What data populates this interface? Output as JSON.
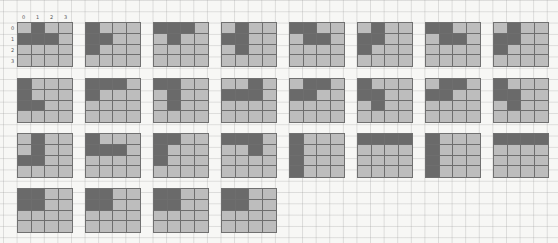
{
  "figure": {
    "grid_size": 4,
    "axis_labels": {
      "columns": [
        "0",
        "1",
        "2",
        "3"
      ],
      "rows": [
        "0",
        "1",
        "2",
        "3"
      ]
    },
    "colors": {
      "filled": "#6a6a6a",
      "empty": "#bdbdbd",
      "grid_line": "#6e6e6e",
      "paper": "#f7f7f5"
    },
    "tiles": [
      {
        "id": 1,
        "filled": [
          [
            0,
            1
          ],
          [
            1,
            0
          ],
          [
            1,
            1
          ],
          [
            1,
            2
          ]
        ]
      },
      {
        "id": 2,
        "filled": [
          [
            0,
            0
          ],
          [
            1,
            0
          ],
          [
            1,
            1
          ],
          [
            2,
            0
          ]
        ]
      },
      {
        "id": 3,
        "filled": [
          [
            0,
            0
          ],
          [
            0,
            1
          ],
          [
            0,
            2
          ],
          [
            1,
            1
          ]
        ]
      },
      {
        "id": 4,
        "filled": [
          [
            0,
            1
          ],
          [
            1,
            0
          ],
          [
            1,
            1
          ],
          [
            2,
            1
          ]
        ]
      },
      {
        "id": 5,
        "filled": [
          [
            0,
            0
          ],
          [
            0,
            1
          ],
          [
            1,
            1
          ],
          [
            1,
            2
          ]
        ]
      },
      {
        "id": 6,
        "filled": [
          [
            0,
            1
          ],
          [
            1,
            0
          ],
          [
            1,
            1
          ],
          [
            2,
            0
          ]
        ]
      },
      {
        "id": 7,
        "filled": [
          [
            0,
            0
          ],
          [
            0,
            1
          ],
          [
            1,
            1
          ],
          [
            1,
            2
          ]
        ]
      },
      {
        "id": 8,
        "filled": [
          [
            0,
            1
          ],
          [
            1,
            0
          ],
          [
            1,
            1
          ],
          [
            2,
            0
          ]
        ]
      },
      {
        "id": 9,
        "filled": [
          [
            0,
            0
          ],
          [
            1,
            0
          ],
          [
            2,
            0
          ],
          [
            2,
            1
          ]
        ]
      },
      {
        "id": 10,
        "filled": [
          [
            0,
            0
          ],
          [
            0,
            1
          ],
          [
            0,
            2
          ],
          [
            1,
            0
          ]
        ]
      },
      {
        "id": 11,
        "filled": [
          [
            0,
            0
          ],
          [
            0,
            1
          ],
          [
            1,
            1
          ],
          [
            2,
            1
          ]
        ]
      },
      {
        "id": 12,
        "filled": [
          [
            0,
            2
          ],
          [
            1,
            0
          ],
          [
            1,
            1
          ],
          [
            1,
            2
          ]
        ]
      },
      {
        "id": 13,
        "filled": [
          [
            0,
            1
          ],
          [
            0,
            2
          ],
          [
            1,
            0
          ],
          [
            1,
            1
          ]
        ]
      },
      {
        "id": 14,
        "filled": [
          [
            0,
            0
          ],
          [
            1,
            0
          ],
          [
            1,
            1
          ],
          [
            2,
            1
          ]
        ]
      },
      {
        "id": 15,
        "filled": [
          [
            0,
            1
          ],
          [
            0,
            2
          ],
          [
            1,
            0
          ],
          [
            1,
            1
          ]
        ]
      },
      {
        "id": 16,
        "filled": [
          [
            0,
            0
          ],
          [
            1,
            0
          ],
          [
            1,
            1
          ],
          [
            2,
            1
          ]
        ]
      },
      {
        "id": 17,
        "filled": [
          [
            0,
            1
          ],
          [
            1,
            1
          ],
          [
            2,
            0
          ],
          [
            2,
            1
          ]
        ]
      },
      {
        "id": 18,
        "filled": [
          [
            0,
            0
          ],
          [
            1,
            0
          ],
          [
            1,
            1
          ],
          [
            1,
            2
          ]
        ]
      },
      {
        "id": 19,
        "filled": [
          [
            0,
            0
          ],
          [
            0,
            1
          ],
          [
            1,
            0
          ],
          [
            2,
            0
          ]
        ]
      },
      {
        "id": 20,
        "filled": [
          [
            0,
            0
          ],
          [
            0,
            1
          ],
          [
            0,
            2
          ],
          [
            1,
            2
          ]
        ]
      },
      {
        "id": 21,
        "filled": [
          [
            0,
            0
          ],
          [
            1,
            0
          ],
          [
            2,
            0
          ],
          [
            3,
            0
          ]
        ]
      },
      {
        "id": 22,
        "filled": [
          [
            0,
            0
          ],
          [
            0,
            1
          ],
          [
            0,
            2
          ],
          [
            0,
            3
          ]
        ]
      },
      {
        "id": 23,
        "filled": [
          [
            0,
            0
          ],
          [
            1,
            0
          ],
          [
            2,
            0
          ],
          [
            3,
            0
          ]
        ]
      },
      {
        "id": 24,
        "filled": [
          [
            0,
            0
          ],
          [
            0,
            1
          ],
          [
            0,
            2
          ],
          [
            0,
            3
          ]
        ]
      },
      {
        "id": 25,
        "filled": [
          [
            0,
            0
          ],
          [
            0,
            1
          ],
          [
            1,
            0
          ],
          [
            1,
            1
          ]
        ]
      },
      {
        "id": 26,
        "filled": [
          [
            0,
            0
          ],
          [
            0,
            1
          ],
          [
            1,
            0
          ],
          [
            1,
            1
          ]
        ]
      },
      {
        "id": 27,
        "filled": [
          [
            0,
            0
          ],
          [
            0,
            1
          ],
          [
            1,
            0
          ],
          [
            1,
            1
          ]
        ]
      },
      {
        "id": 28,
        "filled": [
          [
            0,
            0
          ],
          [
            0,
            1
          ],
          [
            1,
            0
          ],
          [
            1,
            1
          ]
        ]
      }
    ]
  }
}
